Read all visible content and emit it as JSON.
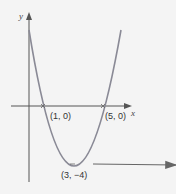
{
  "diagram": {
    "type": "parabola-graph",
    "axes": {
      "x_label": "x",
      "y_label": "y"
    },
    "points": [
      {
        "label": "(1, 0)",
        "x": 1,
        "y": 0
      },
      {
        "label": "(5, 0)",
        "x": 5,
        "y": 0
      },
      {
        "label": "(3, −4)",
        "x": 3,
        "y": -4
      }
    ],
    "arrow": {
      "points_to": "(3, −4)",
      "direction": "left"
    },
    "colors": {
      "curve": "#8a8a96",
      "axes": "#555555",
      "arrow": "#666666"
    }
  }
}
